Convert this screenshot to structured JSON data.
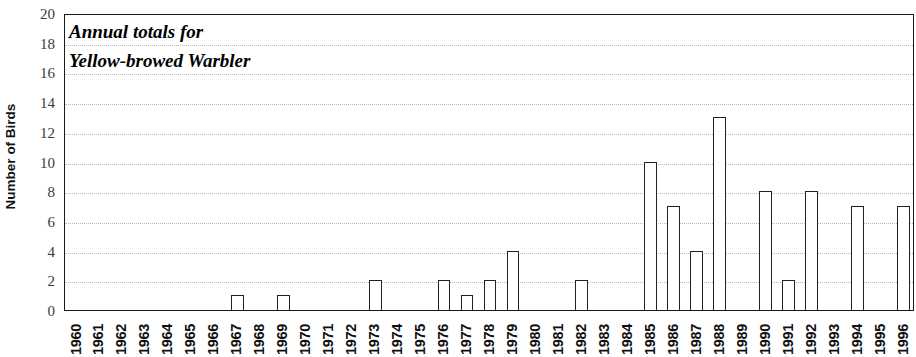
{
  "chart_data": {
    "type": "bar",
    "title": "Annual totals for Yellow-browed Warbler",
    "title_lines": [
      "Annual totals for",
      "Yellow-browed Warbler"
    ],
    "xlabel": "",
    "ylabel": "Number of Birds",
    "ylim": [
      0,
      20
    ],
    "ytick_step": 2,
    "yticks": [
      0,
      2,
      4,
      6,
      8,
      10,
      12,
      14,
      16,
      18,
      20
    ],
    "ytick_labels": [
      "0",
      "2",
      "4",
      "6",
      "8",
      "10",
      "12",
      "14",
      "16",
      "18",
      "20"
    ],
    "grid": true,
    "grid_axis": "y",
    "grid_style": "dotted",
    "legend": null,
    "bar_style": {
      "fill": "#ffffff",
      "edge": "#222222"
    },
    "categories": [
      "1960",
      "1961",
      "1962",
      "1963",
      "1964",
      "1965",
      "1966",
      "1967",
      "1968",
      "1969",
      "1970",
      "1971",
      "1972",
      "1973",
      "1974",
      "1975",
      "1976",
      "1977",
      "1978",
      "1979",
      "1980",
      "1981",
      "1982",
      "1983",
      "1984",
      "1985",
      "1986",
      "1987",
      "1988",
      "1989",
      "1990",
      "1991",
      "1992",
      "1993",
      "1994",
      "1995",
      "1996"
    ],
    "values": [
      0,
      0,
      0,
      0,
      0,
      0,
      0,
      1,
      0,
      1,
      0,
      0,
      0,
      2,
      0,
      0,
      2,
      1,
      2,
      4,
      0,
      0,
      2,
      0,
      0,
      10,
      7,
      4,
      13,
      0,
      8,
      2,
      8,
      0,
      7,
      0,
      7
    ]
  }
}
